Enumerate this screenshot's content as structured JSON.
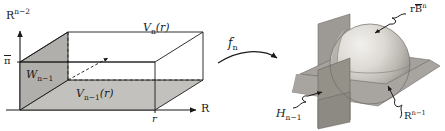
{
  "figure": {
    "colors": {
      "ink": "#1a1a1a",
      "shade_face": "#bdbdbd",
      "shade_face_dark": "#a8a8a8",
      "plane_gray": "#9a9a9a",
      "plane_gray_dark": "#8a8a8a",
      "sphere_light": "#e8e6e2",
      "sphere_mid": "#c9c6c0",
      "sphere_dark": "#9b9892",
      "background": "#ffffff"
    }
  },
  "left_diagram": {
    "name": "box-region",
    "axis_y_label": "R",
    "axis_y_superscript": "n−2",
    "axis_x_label": "R",
    "tick_y_label": "π",
    "tick_x_label": "r",
    "top_face_label": "V",
    "top_face_sub": "n",
    "top_face_arg": "(r)",
    "bottom_face_label": "V",
    "bottom_face_sub": "n−1",
    "bottom_face_arg": "(r)",
    "side_face_label": "W",
    "side_face_sub": "n−1"
  },
  "map": {
    "name": "map-arrow",
    "label": "f",
    "sub": "n"
  },
  "right_diagram": {
    "name": "ball-with-hyperplanes",
    "ball_label_prefix": "r",
    "ball_label_symbol": "B",
    "ball_label_sup": "n",
    "vertical_plane_label": "H",
    "vertical_plane_sub": "n−1",
    "horizontal_plane_label": "R",
    "horizontal_plane_sup": "n−1"
  }
}
